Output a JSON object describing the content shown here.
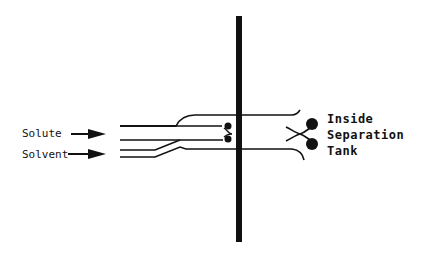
{
  "diagram": {
    "type": "nozzle-injection-schematic",
    "inputs": [
      {
        "label": "Solute"
      },
      {
        "label": "Solvent"
      }
    ],
    "destination": {
      "lines": [
        "Inside",
        "Separation",
        "Tank"
      ]
    },
    "colors": {
      "ink": "#111111",
      "background": "#ffffff"
    }
  }
}
